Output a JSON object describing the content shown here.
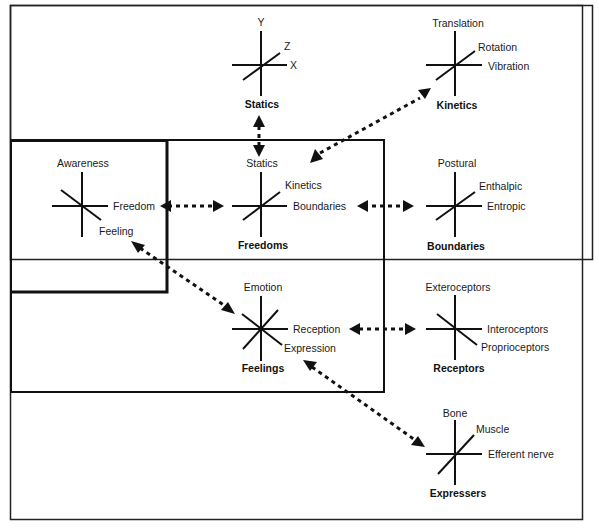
{
  "diagram": {
    "nodes": {
      "statics": {
        "title": "Statics",
        "labels": {
          "top": "Y",
          "diag": "Z",
          "right": "X"
        }
      },
      "kinetics": {
        "title": "Kinetics",
        "labels": {
          "top": "Translation",
          "diag": "Rotation",
          "right": "Vibration"
        }
      },
      "awareness": {
        "labels": {
          "top": "Awareness",
          "right": "Freedom",
          "diag": "Feeling"
        }
      },
      "freedoms": {
        "title": "Freedoms",
        "labels": {
          "top": "Statics",
          "diag": "Kinetics",
          "right": "Boundaries"
        }
      },
      "boundaries": {
        "title": "Boundaries",
        "labels": {
          "top": "Postural",
          "diag": "Enthalpic",
          "right": "Entropic"
        }
      },
      "feelings": {
        "title": "Feelings",
        "labels": {
          "top": "Emotion",
          "right": "Reception",
          "diag": "Expression"
        }
      },
      "receptors": {
        "title": "Receptors",
        "labels": {
          "top": "Exteroceptors",
          "right": "Interoceptors",
          "diag": "Proprioceptors"
        }
      },
      "expressers": {
        "title": "Expressers",
        "labels": {
          "top": "Bone",
          "diag": "Muscle",
          "right": "Efferent nerve"
        }
      }
    },
    "connections": [
      {
        "from": "statics",
        "to": "freedoms",
        "style": "dotted-bidirectional"
      },
      {
        "from": "kinetics",
        "to": "freedoms",
        "style": "dotted-bidirectional"
      },
      {
        "from": "awareness",
        "to": "freedoms",
        "style": "dotted-bidirectional"
      },
      {
        "from": "freedoms",
        "to": "boundaries",
        "style": "dotted-bidirectional"
      },
      {
        "from": "awareness",
        "to": "feelings",
        "style": "dotted-bidirectional"
      },
      {
        "from": "feelings",
        "to": "receptors",
        "style": "dotted-bidirectional"
      },
      {
        "from": "feelings",
        "to": "expressers",
        "style": "dotted-bidirectional"
      }
    ]
  }
}
